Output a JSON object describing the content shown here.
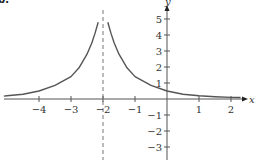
{
  "panel_label": "b.",
  "colors": {
    "axis": "#555555",
    "curve": "#555555",
    "asymptote": "#777777",
    "text": "#333333"
  },
  "chart_data": {
    "type": "line",
    "title": "",
    "xlabel": "x",
    "ylabel": "y",
    "xlim": [
      -5.2,
      2.5
    ],
    "ylim": [
      -3.8,
      5.8
    ],
    "grid": false,
    "legend": null,
    "x_ticks": [
      -4,
      -3,
      -2,
      -1,
      1,
      2
    ],
    "x_tick_labels": [
      "−4",
      "−3",
      "−2",
      "−1",
      "1",
      "2"
    ],
    "y_ticks": [
      -3,
      -2,
      -1,
      1,
      2,
      3,
      4,
      5
    ],
    "y_tick_labels": [
      "−3",
      "−2",
      "−1",
      "1",
      "2",
      "3",
      "4",
      "5"
    ],
    "annotations": [
      {
        "type": "vertical_asymptote",
        "x": -2,
        "style": "dashed"
      }
    ],
    "series": [
      {
        "name": "left branch",
        "x": [
          -5.1,
          -5.0,
          -4.5,
          -4.0,
          -3.5,
          -3.0,
          -2.75,
          -2.5,
          -2.35,
          -2.25,
          -2.15
        ],
        "y": [
          0.18,
          0.2,
          0.3,
          0.5,
          0.85,
          1.4,
          1.95,
          2.8,
          3.5,
          4.1,
          4.8
        ]
      },
      {
        "name": "right branch",
        "x": [
          -1.85,
          -1.75,
          -1.65,
          -1.5,
          -1.25,
          -1.0,
          -0.5,
          0.0,
          0.5,
          1.0,
          1.5,
          2.0,
          2.3
        ],
        "y": [
          4.8,
          4.1,
          3.5,
          2.8,
          1.95,
          1.4,
          0.85,
          0.5,
          0.3,
          0.2,
          0.14,
          0.1,
          0.09
        ]
      }
    ]
  }
}
